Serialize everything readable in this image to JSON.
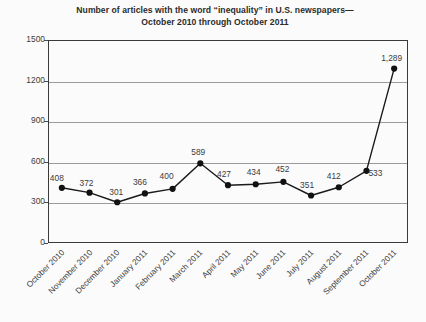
{
  "chart_data": {
    "type": "line",
    "title": "Number of articles with the word “inequality” in U.S. newspapers—",
    "title_line2": "October 2010 through October 2011",
    "subtitle": "",
    "xlabel": "",
    "ylabel": "",
    "ylim": [
      0,
      1500
    ],
    "ytick_values": [
      0,
      300,
      600,
      900,
      1200,
      1500
    ],
    "ytick_labels": [
      "0",
      "300",
      "600",
      "900",
      "1200",
      "1500"
    ],
    "grid": "horizontal gridlines at 300, 600, 900, 1200",
    "legend": "none",
    "categories": [
      "October 2010",
      "November 2010",
      "December 2010",
      "January 2011",
      "February 2011",
      "March 2011",
      "April 2011",
      "May 2011",
      "June 2011",
      "July 2011",
      "August 2011",
      "September 2011",
      "October 2011"
    ],
    "values": [
      408,
      372,
      301,
      366,
      400,
      589,
      427,
      434,
      452,
      351,
      412,
      533,
      1289
    ],
    "point_labels": [
      "408",
      "372",
      "301",
      "366",
      "400",
      "589",
      "427",
      "434",
      "452",
      "351",
      "412",
      "533",
      "1,289"
    ],
    "colors": {
      "line": "#1a1a1a",
      "marker": "#111111",
      "gridline": "#9b9b9b",
      "axis": "#3a3a3a",
      "text": "#3c3c3c",
      "title": "#2b2b2b",
      "background": "#fbfbfb"
    }
  }
}
